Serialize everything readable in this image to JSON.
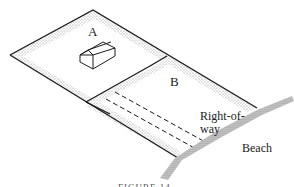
{
  "diagram": {
    "labels": {
      "parcel_a": "A",
      "parcel_b": "B",
      "right_of_way_line1": "Right-of-",
      "right_of_way_line2": "way",
      "beach": "Beach"
    },
    "caption": "FIGURE 14",
    "colors": {
      "line": "#1a1a1a",
      "stipple": "#9a9a9a",
      "background": "#ffffff"
    }
  }
}
